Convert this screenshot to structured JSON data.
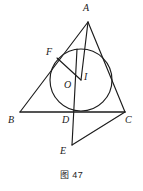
{
  "figure": {
    "caption": "图 47",
    "stroke_color": "#1c1c1c",
    "background_color": "#ffffff",
    "labels": {
      "A": "A",
      "B": "B",
      "C": "C",
      "D": "D",
      "E": "E",
      "F": "F",
      "I": "I",
      "O": "O"
    },
    "points": {
      "A": {
        "x": 88,
        "y": 22
      },
      "B": {
        "x": 20,
        "y": 112
      },
      "C": {
        "x": 125,
        "y": 112
      },
      "D": {
        "x": 81,
        "y": 112
      },
      "E": {
        "x": 72,
        "y": 145
      },
      "F": {
        "x": 57,
        "y": 58
      },
      "I": {
        "x": 81,
        "y": 80
      },
      "O": {
        "x": 75,
        "y": 80
      }
    },
    "circle": {
      "cx": 81,
      "cy": 80,
      "r": 31
    },
    "label_positions": {
      "A": {
        "x": 83,
        "y": 4
      },
      "B": {
        "x": 8,
        "y": 116
      },
      "C": {
        "x": 125,
        "y": 116
      },
      "D": {
        "x": 62,
        "y": 116
      },
      "E": {
        "x": 60,
        "y": 146
      },
      "F": {
        "x": 46,
        "y": 47
      },
      "I": {
        "x": 84,
        "y": 72
      },
      "O": {
        "x": 65,
        "y": 81
      }
    }
  }
}
